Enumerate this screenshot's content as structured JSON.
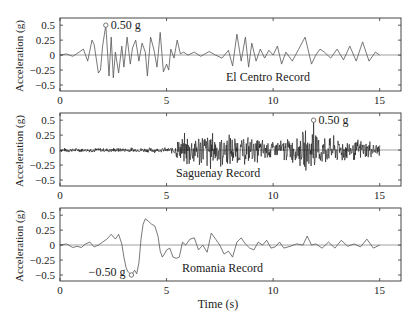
{
  "figure": {
    "xlabel": "Time (s)",
    "ylabel": "Acceleration (g)"
  },
  "chart_data": [
    {
      "type": "line",
      "title": "El Centro Record",
      "xlabel": "",
      "ylabel": "Acceleration (g)",
      "xlim": [
        0,
        16
      ],
      "ylim": [
        -0.6,
        0.62
      ],
      "xticks": [
        0,
        5,
        10,
        15
      ],
      "xtick_labels": [
        "0",
        "5",
        "10",
        "15"
      ],
      "yticks": [
        0.5,
        0.25,
        0,
        -0.25,
        -0.5
      ],
      "ytick_labels": [
        "0.5",
        "0.25",
        "0",
        "−0.25",
        "−0.5"
      ],
      "grid": false,
      "annotation": {
        "text": "0.50 g",
        "x": 2.15,
        "y": 0.5,
        "marker": "circle"
      },
      "series": [
        {
          "name": "El Centro",
          "x": [
            0,
            0.3,
            0.6,
            0.9,
            1.1,
            1.3,
            1.5,
            1.6,
            1.8,
            1.9,
            2.0,
            2.15,
            2.3,
            2.4,
            2.5,
            2.6,
            2.75,
            2.9,
            3.0,
            3.15,
            3.3,
            3.4,
            3.55,
            3.7,
            3.85,
            4.0,
            4.1,
            4.25,
            4.4,
            4.55,
            4.7,
            4.85,
            5.0,
            5.1,
            5.2,
            5.35,
            5.5,
            5.65,
            5.8,
            6.0,
            6.3,
            6.6,
            7.0,
            7.3,
            7.6,
            7.9,
            8.1,
            8.3,
            8.5,
            8.7,
            8.85,
            9.0,
            9.2,
            9.4,
            9.6,
            9.8,
            10.0,
            10.2,
            10.4,
            10.6,
            10.9,
            11.2,
            11.5,
            11.8,
            12.0,
            12.2,
            12.4,
            12.7,
            13.0,
            13.3,
            13.6,
            13.9,
            14.2,
            14.5,
            14.8,
            15.0
          ],
          "y": [
            0,
            0.02,
            -0.02,
            0.05,
            0.1,
            -0.1,
            0.25,
            0.18,
            -0.3,
            -0.25,
            0.15,
            0.5,
            -0.35,
            0.3,
            -0.38,
            0.05,
            -0.3,
            0.15,
            -0.2,
            0.3,
            -0.15,
            0.12,
            0.25,
            -0.1,
            0.2,
            0.05,
            -0.35,
            0.3,
            0.1,
            -0.2,
            0.38,
            -0.28,
            -0.15,
            -0.25,
            0.1,
            -0.05,
            0.25,
            0.02,
            0.05,
            0.0,
            0.05,
            -0.02,
            0.06,
            0.0,
            -0.05,
            0.08,
            -0.18,
            0.35,
            -0.1,
            0.3,
            -0.2,
            0.2,
            -0.1,
            0.1,
            -0.05,
            0.08,
            0.0,
            0.15,
            -0.15,
            0.05,
            -0.1,
            0.1,
            0.3,
            -0.15,
            0.0,
            0.1,
            0.05,
            -0.05,
            0.1,
            -0.08,
            0.15,
            -0.1,
            0.22,
            -0.1,
            0.05,
            0.0
          ]
        }
      ]
    },
    {
      "type": "line",
      "title": "Saguenay Record",
      "xlabel": "",
      "ylabel": "Acceleration (g)",
      "xlim": [
        0,
        16
      ],
      "ylim": [
        -0.6,
        0.62
      ],
      "xticks": [
        0,
        5,
        10,
        15
      ],
      "xtick_labels": [
        "0",
        "5",
        "10",
        "15"
      ],
      "yticks": [
        0.5,
        0.25,
        0,
        -0.25,
        -0.5
      ],
      "ytick_labels": [
        "0.5",
        "0.25",
        "0",
        "−0.25",
        "−0.5"
      ],
      "grid": false,
      "annotation": {
        "text": "0.50 g",
        "x": 11.9,
        "y": 0.5,
        "marker": "circle"
      },
      "series": [
        {
          "name": "Saguenay",
          "envelope": {
            "x": [
              0,
              5.2,
              5.5,
              6.0,
              7.0,
              8.0,
              9.0,
              10.0,
              11.0,
              11.9,
              12.5,
              13.5,
              14.5,
              15.0
            ],
            "amplitude": [
              0.04,
              0.05,
              0.2,
              0.35,
              0.38,
              0.3,
              0.25,
              0.2,
              0.25,
              0.5,
              0.28,
              0.22,
              0.18,
              0.15
            ]
          }
        }
      ]
    },
    {
      "type": "line",
      "title": "Romania Record",
      "xlabel": "Time (s)",
      "ylabel": "Acceleration (g)",
      "xlim": [
        0,
        16
      ],
      "ylim": [
        -0.6,
        0.62
      ],
      "xticks": [
        0,
        5,
        10,
        15
      ],
      "xtick_labels": [
        "0",
        "5",
        "10",
        "15"
      ],
      "yticks": [
        0.5,
        0.25,
        0,
        -0.25,
        -0.5
      ],
      "ytick_labels": [
        "0.5",
        "0.25",
        "0",
        "−0.25",
        "−0.5"
      ],
      "grid": false,
      "annotation": {
        "text": "−0.50 g",
        "x": 3.35,
        "y": -0.5,
        "marker": "circle"
      },
      "series": [
        {
          "name": "Romania",
          "x": [
            0,
            0.3,
            0.6,
            0.8,
            1.0,
            1.2,
            1.4,
            1.6,
            1.8,
            2.0,
            2.2,
            2.4,
            2.6,
            2.75,
            2.9,
            3.0,
            3.1,
            3.2,
            3.35,
            3.5,
            3.6,
            3.7,
            3.8,
            3.9,
            4.0,
            4.15,
            4.3,
            4.45,
            4.6,
            4.7,
            4.8,
            4.9,
            5.0,
            5.15,
            5.3,
            5.45,
            5.6,
            5.75,
            5.9,
            6.1,
            6.3,
            6.5,
            6.7,
            6.9,
            7.1,
            7.3,
            7.5,
            7.7,
            7.9,
            8.1,
            8.3,
            8.5,
            8.7,
            8.9,
            9.1,
            9.3,
            9.5,
            9.7,
            9.9,
            10.1,
            10.3,
            10.5,
            10.8,
            11.1,
            11.4,
            11.6,
            11.8,
            12.0,
            12.3,
            12.6,
            12.9,
            13.2,
            13.5,
            13.8,
            14.1,
            14.4,
            14.7,
            15.0
          ],
          "y": [
            0.0,
            0.02,
            -0.04,
            -0.02,
            -0.04,
            0.02,
            0.05,
            -0.03,
            0.0,
            0.05,
            0.1,
            0.18,
            0.1,
            0.18,
            0.02,
            -0.2,
            -0.38,
            -0.45,
            -0.5,
            -0.42,
            -0.48,
            -0.3,
            0.1,
            0.35,
            0.44,
            0.4,
            0.35,
            0.32,
            0.15,
            -0.1,
            -0.2,
            -0.15,
            -0.08,
            -0.05,
            -0.2,
            -0.22,
            -0.2,
            0.05,
            0.0,
            0.1,
            0.12,
            -0.08,
            0.0,
            -0.12,
            0.2,
            0.1,
            0.0,
            -0.15,
            -0.1,
            -0.2,
            0.05,
            0.12,
            0.02,
            -0.05,
            -0.08,
            0.05,
            0.0,
            0.08,
            -0.05,
            -0.03,
            0.05,
            -0.05,
            -0.02,
            0.02,
            0.0,
            0.15,
            0.0,
            0.02,
            -0.05,
            0.05,
            -0.05,
            0.08,
            -0.02,
            0.02,
            -0.03,
            0.1,
            -0.05,
            0.0
          ]
        }
      ]
    }
  ]
}
